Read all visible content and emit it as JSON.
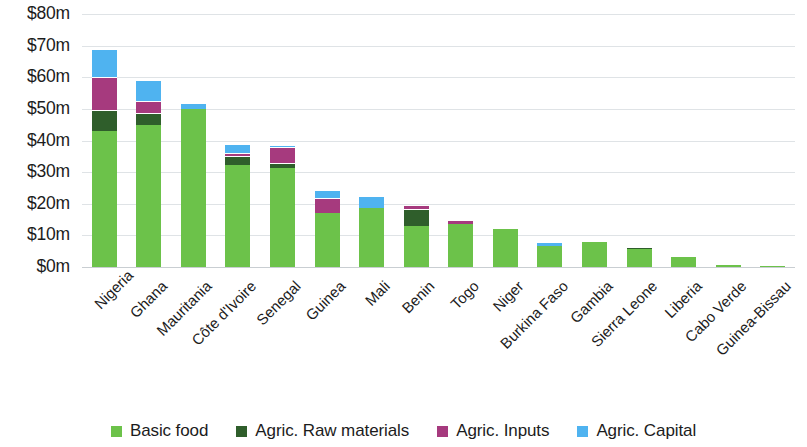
{
  "chart_data": {
    "type": "bar",
    "subtype": "stacked-bar",
    "title": "",
    "xlabel": "",
    "ylabel": "",
    "ylim": [
      0,
      80
    ],
    "ytick_values": [
      80,
      70,
      60,
      50,
      40,
      30,
      20,
      10,
      0
    ],
    "ytick_labels": [
      "$80m",
      "$70m",
      "$60m",
      "$50m",
      "$40m",
      "$30m",
      "$20m",
      "$10m",
      "$0m"
    ],
    "grid": true,
    "legend_position": "bottom",
    "units": "millions of USD",
    "categories": [
      "Nigeria",
      "Ghana",
      "Mauritania",
      "Côte d'Ivoire",
      "Senegal",
      "Guinea",
      "Mali",
      "Benin",
      "Togo",
      "Niger",
      "Burkina Faso",
      "Gambia",
      "Sierra Leone",
      "Liberia",
      "Cabo Verde",
      "Guinea-Bissau"
    ],
    "series": [
      {
        "name": "Basic food",
        "color": "#6cc24a",
        "values": [
          43.0,
          45.0,
          50.0,
          32.3,
          31.3,
          17.0,
          18.7,
          13.0,
          13.6,
          12.0,
          6.5,
          8.0,
          5.8,
          3.3,
          0.5,
          0.1
        ]
      },
      {
        "name": "Agric. Raw materials",
        "color": "#2f5e2b",
        "values": [
          6.5,
          3.7,
          0.0,
          2.7,
          1.7,
          0.0,
          0.0,
          5.4,
          0.0,
          0.0,
          0.0,
          0.0,
          0.4,
          0.0,
          0.0,
          0.0
        ]
      },
      {
        "name": "Agric. Inputs",
        "color": "#a63a7e",
        "values": [
          10.5,
          3.8,
          0.0,
          1.0,
          5.0,
          4.8,
          0.0,
          1.2,
          1.4,
          0.4,
          0.0,
          0.0,
          0.2,
          0.0,
          0.0,
          0.0
        ]
      },
      {
        "name": "Agric. Capital",
        "color": "#4fb3f0",
        "values": [
          9.0,
          6.5,
          2.0,
          3.0,
          0.6,
          2.6,
          3.8,
          0.0,
          0.0,
          0.0,
          1.5,
          0.0,
          0.4,
          0.0,
          0.0,
          0.0
        ]
      }
    ],
    "totals": [
      69.0,
      59.0,
      52.0,
      39.0,
      38.6,
      24.4,
      22.5,
      19.6,
      15.0,
      12.4,
      8.0,
      8.0,
      6.8,
      3.3,
      0.5,
      0.1
    ]
  },
  "legend": {
    "items": [
      {
        "label": "Basic food",
        "color": "#6cc24a"
      },
      {
        "label": "Agric. Raw materials",
        "color": "#2f5e2b"
      },
      {
        "label": "Agric. Inputs",
        "color": "#a63a7e"
      },
      {
        "label": "Agric. Capital",
        "color": "#4fb3f0"
      }
    ]
  },
  "colors": {
    "basic_food": "#6cc24a",
    "raw_materials": "#2f5e2b",
    "inputs": "#a63a7e",
    "capital": "#4fb3f0",
    "gridline": "#dfe3e6",
    "text": "#1c1c1c",
    "background": "#ffffff"
  }
}
